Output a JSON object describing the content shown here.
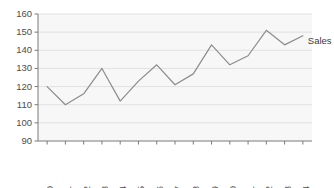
{
  "chart_data": {
    "type": "line",
    "title": "",
    "xlabel": "",
    "ylabel": "",
    "categories": [
      "2000",
      "2001",
      "2002",
      "2003",
      "2004",
      "2005",
      "2006",
      "2007",
      "2008",
      "2009",
      "2010",
      "2011",
      "2012",
      "2013",
      "2014"
    ],
    "x": [
      2000,
      2001,
      2002,
      2003,
      2004,
      2005,
      2006,
      2007,
      2008,
      2009,
      2010,
      2011,
      2012,
      2013,
      2014
    ],
    "series": [
      {
        "name": "Sales",
        "values": [
          120,
          110,
          116,
          130,
          112,
          123,
          132,
          121,
          127,
          143,
          132,
          137,
          151,
          143,
          148
        ]
      }
    ],
    "ylim": [
      90,
      160
    ],
    "yticks": [
      90,
      100,
      110,
      120,
      130,
      140,
      150,
      160
    ],
    "ytick_labels": [
      "90",
      "100",
      "110",
      "120",
      "130",
      "140",
      "150",
      "160"
    ],
    "xtick_labels": [
      "2000",
      "2001",
      "2002",
      "2003",
      "2004",
      "2005",
      "2006",
      "2007",
      "2008",
      "2009",
      "2010",
      "2011",
      "2012",
      "2013",
      "2014"
    ],
    "grid": true,
    "legend": "inline-end-label",
    "annotations": [
      {
        "text": "Sales",
        "x": 2014,
        "y": 148
      }
    ],
    "colors": {
      "line": "#8c8c8c",
      "grid": "#dcdcdc",
      "axis": "#7a7a7a",
      "plot_background": "#f7f7f7",
      "text": "#4d4d4d"
    }
  }
}
